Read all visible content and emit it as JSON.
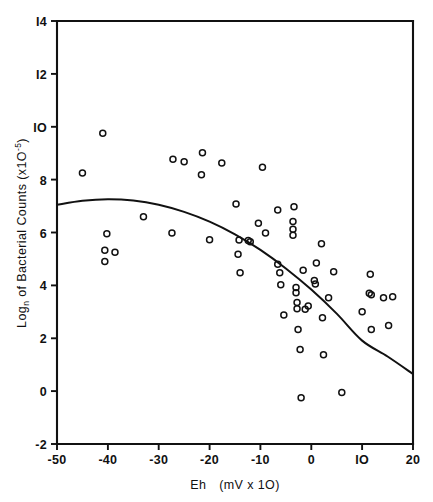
{
  "chart_data": {
    "type": "scatter",
    "title": "",
    "xlabel": "Eh  (mV x 10)",
    "ylabel": "Log_n of Bacterial Counts (x10^-5)",
    "ylabel_parts": {
      "main_a": "Log",
      "sub": "n",
      "main_b": " of Bacterial Counts (x1O",
      "sup": "-5",
      "main_c": ")"
    },
    "xlabel_parts": {
      "a": "Eh",
      "b": "(mV x 1O)"
    },
    "xlim": [
      -50,
      20
    ],
    "ylim": [
      -2,
      14
    ],
    "xticks": [
      -50,
      -40,
      -30,
      -20,
      -10,
      0,
      10,
      20
    ],
    "xticklabels": [
      "-50",
      "-40",
      "-30",
      "-20",
      "-10",
      "0",
      "IO",
      "20"
    ],
    "yticks": [
      -2,
      0,
      2,
      4,
      6,
      8,
      10,
      12,
      14
    ],
    "yticklabels": [
      "-2",
      "0",
      "2",
      "4",
      "6",
      "8",
      "IO",
      "I2",
      "I4"
    ],
    "grid": false,
    "legend": null,
    "marker": "open-circle",
    "marker_color": "#111111",
    "line_color": "#111111",
    "points": [
      [
        -45.0,
        8.25
      ],
      [
        -41.0,
        9.75
      ],
      [
        -40.2,
        5.95
      ],
      [
        -40.6,
        5.33
      ],
      [
        -40.6,
        4.9
      ],
      [
        -38.6,
        5.25
      ],
      [
        -33.0,
        6.6
      ],
      [
        -27.4,
        5.98
      ],
      [
        -27.2,
        8.77
      ],
      [
        -25.0,
        8.68
      ],
      [
        -21.4,
        9.02
      ],
      [
        -21.6,
        8.18
      ],
      [
        -20.0,
        5.73
      ],
      [
        -17.6,
        8.63
      ],
      [
        -14.8,
        7.08
      ],
      [
        -14.2,
        5.72
      ],
      [
        -14.4,
        5.18
      ],
      [
        -14.0,
        4.48
      ],
      [
        -12.4,
        5.7
      ],
      [
        -12.0,
        5.65
      ],
      [
        -10.4,
        6.35
      ],
      [
        -9.6,
        8.47
      ],
      [
        -9.0,
        5.98
      ],
      [
        -6.6,
        6.85
      ],
      [
        -6.6,
        4.8
      ],
      [
        -6.2,
        4.48
      ],
      [
        -6.0,
        4.02
      ],
      [
        -5.4,
        2.88
      ],
      [
        -3.4,
        6.97
      ],
      [
        -3.6,
        6.42
      ],
      [
        -3.6,
        6.12
      ],
      [
        -3.6,
        5.9
      ],
      [
        -3.0,
        3.92
      ],
      [
        -3.0,
        3.72
      ],
      [
        -2.8,
        3.35
      ],
      [
        -2.8,
        3.12
      ],
      [
        -2.6,
        2.33
      ],
      [
        -2.2,
        1.57
      ],
      [
        -2.0,
        -0.25
      ],
      [
        -1.6,
        4.57
      ],
      [
        -1.2,
        3.1
      ],
      [
        -0.6,
        3.22
      ],
      [
        0.6,
        4.18
      ],
      [
        0.8,
        4.05
      ],
      [
        1.0,
        4.85
      ],
      [
        2.0,
        5.57
      ],
      [
        2.2,
        2.78
      ],
      [
        2.4,
        1.38
      ],
      [
        3.4,
        3.53
      ],
      [
        4.4,
        4.52
      ],
      [
        6.0,
        -0.05
      ],
      [
        10.0,
        3.0
      ],
      [
        11.4,
        3.7
      ],
      [
        11.8,
        3.65
      ],
      [
        11.6,
        4.42
      ],
      [
        11.8,
        2.33
      ],
      [
        14.2,
        3.53
      ],
      [
        15.2,
        2.48
      ],
      [
        16.0,
        3.57
      ]
    ],
    "fit_curve": {
      "kind": "quadratic",
      "description": "fitted regression curve",
      "x_range": [
        -50,
        20
      ],
      "points": [
        [
          -50.0,
          7.05
        ],
        [
          -45.0,
          7.2
        ],
        [
          -40.0,
          7.26
        ],
        [
          -35.0,
          7.21
        ],
        [
          -30.0,
          7.05
        ],
        [
          -25.0,
          6.78
        ],
        [
          -20.0,
          6.41
        ],
        [
          -15.0,
          5.93
        ],
        [
          -10.0,
          5.34
        ],
        [
          -5.0,
          4.64
        ],
        [
          0.0,
          3.84
        ],
        [
          5.0,
          2.93
        ],
        [
          10.0,
          1.91
        ],
        [
          15.0,
          1.31
        ],
        [
          20.0,
          0.65
        ]
      ]
    }
  }
}
